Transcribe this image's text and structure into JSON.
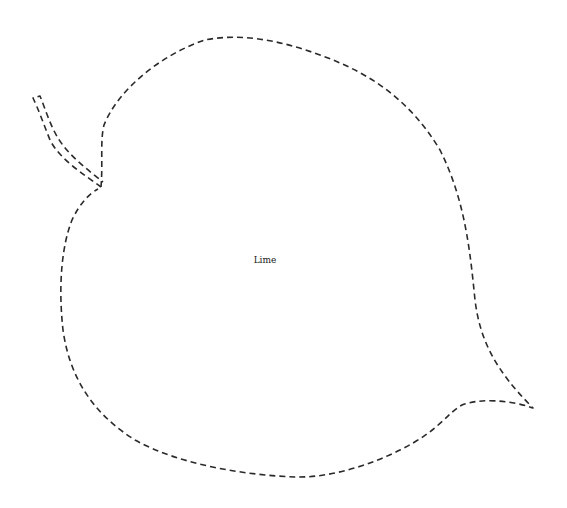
{
  "diagram": {
    "type": "leaf-cutout-template",
    "label": "Lime",
    "outline_style": "dashed",
    "stroke_color": "#2a2a2a",
    "background": "#ffffff"
  }
}
